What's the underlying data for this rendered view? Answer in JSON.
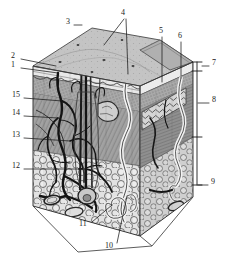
{
  "figure": {
    "style": "grayscale anatomical engraving",
    "background_color": "#ffffff",
    "ink_color": "#1a1a1a",
    "width": 228,
    "height": 270
  },
  "labels": [
    {
      "id": "1",
      "text": "1",
      "x": 11,
      "y": 65,
      "anchor": "left"
    },
    {
      "id": "2",
      "text": "2",
      "x": 11,
      "y": 56,
      "anchor": "left"
    },
    {
      "id": "3",
      "text": "3",
      "x": 66,
      "y": 22,
      "anchor": "left"
    },
    {
      "id": "4",
      "text": "4",
      "x": 121,
      "y": 13,
      "anchor": "left"
    },
    {
      "id": "5",
      "text": "5",
      "x": 159,
      "y": 31,
      "anchor": "left"
    },
    {
      "id": "6",
      "text": "6",
      "x": 178,
      "y": 36,
      "anchor": "left"
    },
    {
      "id": "7",
      "text": "7",
      "x": 212,
      "y": 63,
      "anchor": "left"
    },
    {
      "id": "8",
      "text": "8",
      "x": 212,
      "y": 100,
      "anchor": "left"
    },
    {
      "id": "9",
      "text": "9",
      "x": 211,
      "y": 182,
      "anchor": "left"
    },
    {
      "id": "10",
      "text": "10",
      "x": 107,
      "y": 246,
      "anchor": "left"
    },
    {
      "id": "11",
      "text": "11",
      "x": 79,
      "y": 224,
      "anchor": "left"
    },
    {
      "id": "12",
      "text": "12",
      "x": 13,
      "y": 166,
      "anchor": "left"
    },
    {
      "id": "13",
      "text": "13",
      "x": 13,
      "y": 135,
      "anchor": "left"
    },
    {
      "id": "14",
      "text": "14",
      "x": 13,
      "y": 113,
      "anchor": "left"
    },
    {
      "id": "15",
      "text": "15",
      "x": 13,
      "y": 95,
      "anchor": "left"
    }
  ],
  "leader_lines": [
    {
      "for": "1",
      "path": "M21,68 L58,73"
    },
    {
      "for": "2",
      "path": "M21,59 L56,66"
    },
    {
      "for": "3",
      "path": "M74,25 L82,25"
    },
    {
      "for": "4a",
      "path": "M124,19 L104,45"
    },
    {
      "for": "4b",
      "path": "M126,19 L128,74"
    },
    {
      "for": "5",
      "path": "M162,37 L162,82"
    },
    {
      "for": "6",
      "path": "M181,42 L181,78"
    },
    {
      "for": "7",
      "path": "M209,66 L199,66"
    },
    {
      "for": "8",
      "path": "M209,103 L200,103"
    },
    {
      "for": "9",
      "path": "M208,185 L199,185"
    },
    {
      "for": "10",
      "path": "M117,243 L127,196"
    },
    {
      "for": "11",
      "path": "M92,222 L112,205"
    },
    {
      "for": "12",
      "path": "M24,169 L79,169"
    },
    {
      "for": "13",
      "path": "M24,138 L70,141"
    },
    {
      "for": "14",
      "path": "M24,116 L58,118"
    },
    {
      "for": "15",
      "path": "M24,98 L62,101"
    }
  ],
  "depth_bracket": {
    "x": 197,
    "ticks_y": [
      62,
      71,
      137,
      185
    ],
    "segments": [
      {
        "label_ref": "7",
        "from_y": 62,
        "to_y": 71
      },
      {
        "label_ref": "8",
        "from_y": 71,
        "to_y": 137
      },
      {
        "label_ref": "9",
        "from_y": 137,
        "to_y": 185
      }
    ]
  },
  "tissue_layers": [
    {
      "name": "epidermis",
      "tone": "#b8b8b8"
    },
    {
      "name": "dermis",
      "tone": "#9a9a9a"
    },
    {
      "name": "subcutaneous-fat",
      "tone": "#d8d8d8"
    }
  ],
  "structures": [
    {
      "name": "hair-shaft"
    },
    {
      "name": "hair-follicle"
    },
    {
      "name": "sweat-gland-duct"
    },
    {
      "name": "sweat-gland-coil"
    },
    {
      "name": "sebaceous-gland"
    },
    {
      "name": "blood-vessel-network"
    },
    {
      "name": "nerve-ending"
    },
    {
      "name": "skin-pore"
    },
    {
      "name": "fat-lobule"
    },
    {
      "name": "lamellar-corpuscle"
    }
  ]
}
